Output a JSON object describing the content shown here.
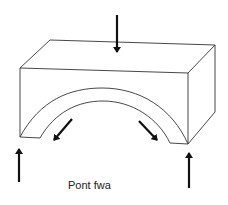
{
  "diagram": {
    "caption": "Pont fwa",
    "colors": {
      "line": "#333333",
      "arrow": "#111111",
      "background": "#ffffff"
    },
    "arrows": [
      {
        "name": "top-load-arrow",
        "direction": "down"
      },
      {
        "name": "left-support-arrow",
        "direction": "up"
      },
      {
        "name": "right-support-arrow",
        "direction": "up"
      },
      {
        "name": "left-thrust-arrow",
        "direction": "down-left"
      },
      {
        "name": "right-thrust-arrow",
        "direction": "down-right"
      }
    ]
  }
}
